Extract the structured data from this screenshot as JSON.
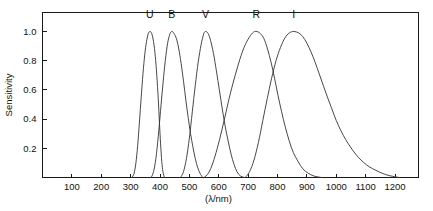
{
  "chart_data": {
    "type": "line",
    "title": "",
    "xlabel": "(λ/nm)",
    "ylabel": "Sensitivity",
    "xlim": [
      0,
      1280
    ],
    "ylim": [
      0,
      1.13
    ],
    "grid": false,
    "legend_position": "inline-above-peaks",
    "xticks": [
      100,
      200,
      300,
      400,
      500,
      600,
      700,
      800,
      900,
      1000,
      1100,
      1200
    ],
    "xtick_labels": [
      "100",
      "200",
      "300",
      "400",
      "500",
      "600",
      "700",
      "800",
      "900",
      "1000",
      "1100",
      "1200"
    ],
    "yticks": [
      0.2,
      0.4,
      0.6,
      0.8,
      1.0
    ],
    "ytick_labels": [
      "0.2",
      "0.4",
      "0.6",
      "0.8",
      "1.0"
    ],
    "annotations": [
      {
        "text": "U",
        "x": 365,
        "y": 1.09
      },
      {
        "text": "B",
        "x": 440,
        "y": 1.09
      },
      {
        "text": "V",
        "x": 555,
        "y": 1.09
      },
      {
        "text": "R",
        "x": 728,
        "y": 1.09
      },
      {
        "text": "I",
        "x": 855,
        "y": 1.09
      }
    ],
    "line_color": "#333333",
    "series": [
      {
        "name": "U",
        "peak_x": 365,
        "peak_y": 1.0,
        "points": [
          [
            305,
            0.0
          ],
          [
            312,
            0.03
          ],
          [
            318,
            0.1
          ],
          [
            324,
            0.22
          ],
          [
            330,
            0.38
          ],
          [
            336,
            0.55
          ],
          [
            342,
            0.71
          ],
          [
            348,
            0.84
          ],
          [
            354,
            0.93
          ],
          [
            360,
            0.985
          ],
          [
            366,
            1.0
          ],
          [
            372,
            0.985
          ],
          [
            378,
            0.93
          ],
          [
            384,
            0.83
          ],
          [
            389,
            0.7
          ],
          [
            394,
            0.54
          ],
          [
            398,
            0.38
          ],
          [
            402,
            0.23
          ],
          [
            406,
            0.11
          ],
          [
            410,
            0.04
          ],
          [
            415,
            0.0
          ]
        ]
      },
      {
        "name": "B",
        "peak_x": 440,
        "peak_y": 1.0,
        "points": [
          [
            370,
            0.0
          ],
          [
            378,
            0.04
          ],
          [
            386,
            0.13
          ],
          [
            394,
            0.28
          ],
          [
            402,
            0.46
          ],
          [
            410,
            0.64
          ],
          [
            418,
            0.8
          ],
          [
            426,
            0.92
          ],
          [
            434,
            0.985
          ],
          [
            441,
            1.0
          ],
          [
            448,
            0.985
          ],
          [
            456,
            0.95
          ],
          [
            464,
            0.88
          ],
          [
            472,
            0.78
          ],
          [
            480,
            0.66
          ],
          [
            488,
            0.53
          ],
          [
            496,
            0.41
          ],
          [
            504,
            0.3
          ],
          [
            512,
            0.21
          ],
          [
            520,
            0.13
          ],
          [
            528,
            0.07
          ],
          [
            536,
            0.03
          ],
          [
            545,
            0.0
          ]
        ]
      },
      {
        "name": "V",
        "peak_x": 555,
        "peak_y": 1.0,
        "points": [
          [
            470,
            0.0
          ],
          [
            480,
            0.04
          ],
          [
            490,
            0.13
          ],
          [
            500,
            0.27
          ],
          [
            510,
            0.45
          ],
          [
            520,
            0.63
          ],
          [
            530,
            0.79
          ],
          [
            540,
            0.91
          ],
          [
            549,
            0.985
          ],
          [
            556,
            1.0
          ],
          [
            564,
            0.985
          ],
          [
            572,
            0.94
          ],
          [
            582,
            0.85
          ],
          [
            592,
            0.73
          ],
          [
            602,
            0.6
          ],
          [
            612,
            0.47
          ],
          [
            622,
            0.35
          ],
          [
            632,
            0.25
          ],
          [
            642,
            0.16
          ],
          [
            652,
            0.09
          ],
          [
            662,
            0.04
          ],
          [
            674,
            0.01
          ],
          [
            688,
            0.0
          ]
        ]
      },
      {
        "name": "R",
        "peak_x": 728,
        "peak_y": 1.0,
        "points": [
          [
            550,
            0.0
          ],
          [
            565,
            0.03
          ],
          [
            580,
            0.1
          ],
          [
            595,
            0.2
          ],
          [
            610,
            0.32
          ],
          [
            625,
            0.45
          ],
          [
            640,
            0.58
          ],
          [
            656,
            0.7
          ],
          [
            672,
            0.81
          ],
          [
            688,
            0.9
          ],
          [
            704,
            0.96
          ],
          [
            718,
            0.995
          ],
          [
            730,
            1.0
          ],
          [
            742,
            0.985
          ],
          [
            754,
            0.95
          ],
          [
            766,
            0.88
          ],
          [
            778,
            0.79
          ],
          [
            790,
            0.68
          ],
          [
            802,
            0.56
          ],
          [
            814,
            0.45
          ],
          [
            826,
            0.35
          ],
          [
            840,
            0.25
          ],
          [
            854,
            0.17
          ],
          [
            870,
            0.11
          ],
          [
            886,
            0.06
          ],
          [
            904,
            0.03
          ],
          [
            924,
            0.01
          ],
          [
            950,
            0.0
          ]
        ]
      },
      {
        "name": "I",
        "peak_x": 855,
        "peak_y": 1.0,
        "points": [
          [
            690,
            0.0
          ],
          [
            705,
            0.04
          ],
          [
            720,
            0.12
          ],
          [
            735,
            0.24
          ],
          [
            750,
            0.39
          ],
          [
            765,
            0.54
          ],
          [
            780,
            0.68
          ],
          [
            795,
            0.8
          ],
          [
            810,
            0.89
          ],
          [
            825,
            0.955
          ],
          [
            840,
            0.99
          ],
          [
            856,
            1.0
          ],
          [
            872,
            0.99
          ],
          [
            886,
            0.965
          ],
          [
            900,
            0.92
          ],
          [
            914,
            0.86
          ],
          [
            928,
            0.79
          ],
          [
            942,
            0.71
          ],
          [
            956,
            0.63
          ],
          [
            970,
            0.55
          ],
          [
            985,
            0.47
          ],
          [
            1000,
            0.39
          ],
          [
            1016,
            0.32
          ],
          [
            1032,
            0.26
          ],
          [
            1048,
            0.21
          ],
          [
            1066,
            0.16
          ],
          [
            1084,
            0.12
          ],
          [
            1104,
            0.085
          ],
          [
            1124,
            0.06
          ],
          [
            1146,
            0.038
          ],
          [
            1168,
            0.02
          ],
          [
            1192,
            0.008
          ],
          [
            1215,
            0.0
          ]
        ]
      }
    ]
  }
}
